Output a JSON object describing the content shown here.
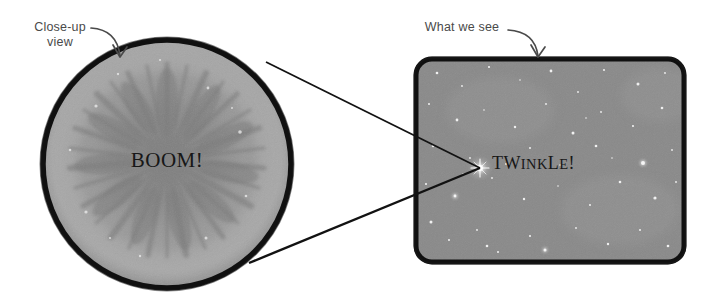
{
  "figure": {
    "background_color": "#ffffff",
    "ink_color": "#111111",
    "label_color": "#4a4a4a"
  },
  "annotations": [
    {
      "id": "closeup",
      "text": "Close-up\nview",
      "arrow": "curved-arrow-down-right",
      "points_to": "closeup-circle"
    },
    {
      "id": "whatwesee",
      "text": "What we see",
      "arrow": "curved-arrow-down-right",
      "points_to": "sky-panel"
    }
  ],
  "closeup_panel": {
    "shape": "circle",
    "caption": "BOOM!",
    "fill_color": "#8f8f8f",
    "outline_color": "#141414",
    "subject": "exploding-star-radial-burst"
  },
  "sky_panel": {
    "shape": "rounded-rectangle",
    "caption": "TWINKLE!",
    "caption_parts": {
      "t": "T",
      "w": "W",
      "ink": "INK",
      "l": "L",
      "e": "E",
      "bang": "!"
    },
    "fill_color": "#8a8a8a",
    "outline_color": "#141414",
    "subject": "starfield-with-one-bright-star"
  },
  "connector_lines": {
    "count": 2,
    "description": "two straight magnifier lines from circle edge to bright star",
    "color": "#121212"
  }
}
